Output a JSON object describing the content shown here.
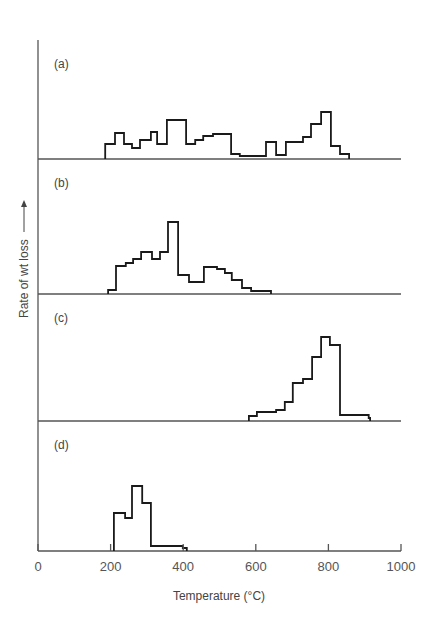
{
  "chart_data": {
    "type": "line",
    "subtype": "step-histogram",
    "title": "",
    "xlabel": "Temperature (°C)",
    "ylabel": "Rate of wt loss",
    "ylabel_arrow": "up",
    "xlim": [
      0,
      1000
    ],
    "x_ticks": [
      0,
      200,
      400,
      600,
      800,
      1000
    ],
    "x_tick_labels": [
      "0",
      "200",
      "400",
      "600",
      "800",
      "1000"
    ],
    "y_units": "relative (arbitrary)",
    "grid": false,
    "legend": null,
    "panels": [
      {
        "label": "(a)",
        "steps": [
          {
            "from": 185,
            "to": 212,
            "value": 15
          },
          {
            "from": 212,
            "to": 237,
            "value": 26
          },
          {
            "from": 237,
            "to": 259,
            "value": 15
          },
          {
            "from": 259,
            "to": 281,
            "value": 11
          },
          {
            "from": 281,
            "to": 311,
            "value": 19
          },
          {
            "from": 311,
            "to": 328,
            "value": 27
          },
          {
            "from": 328,
            "to": 355,
            "value": 15
          },
          {
            "from": 355,
            "to": 408,
            "value": 39
          },
          {
            "from": 408,
            "to": 433,
            "value": 15
          },
          {
            "from": 433,
            "to": 455,
            "value": 19
          },
          {
            "from": 455,
            "to": 482,
            "value": 23
          },
          {
            "from": 482,
            "to": 532,
            "value": 25
          },
          {
            "from": 532,
            "to": 556,
            "value": 5
          },
          {
            "from": 556,
            "to": 628,
            "value": 3
          },
          {
            "from": 628,
            "to": 656,
            "value": 17
          },
          {
            "from": 656,
            "to": 683,
            "value": 4
          },
          {
            "from": 683,
            "to": 730,
            "value": 17
          },
          {
            "from": 730,
            "to": 752,
            "value": 22
          },
          {
            "from": 752,
            "to": 780,
            "value": 35
          },
          {
            "from": 780,
            "to": 807,
            "value": 47
          },
          {
            "from": 807,
            "to": 832,
            "value": 13
          },
          {
            "from": 832,
            "to": 857,
            "value": 5
          }
        ]
      },
      {
        "label": "(b)",
        "steps": [
          {
            "from": 193,
            "to": 215,
            "value": 4
          },
          {
            "from": 215,
            "to": 242,
            "value": 28
          },
          {
            "from": 242,
            "to": 262,
            "value": 31
          },
          {
            "from": 262,
            "to": 284,
            "value": 35
          },
          {
            "from": 284,
            "to": 314,
            "value": 42
          },
          {
            "from": 314,
            "to": 336,
            "value": 35
          },
          {
            "from": 336,
            "to": 358,
            "value": 42
          },
          {
            "from": 358,
            "to": 386,
            "value": 72
          },
          {
            "from": 386,
            "to": 416,
            "value": 19
          },
          {
            "from": 416,
            "to": 457,
            "value": 12
          },
          {
            "from": 457,
            "to": 493,
            "value": 27
          },
          {
            "from": 493,
            "to": 515,
            "value": 25
          },
          {
            "from": 515,
            "to": 534,
            "value": 21
          },
          {
            "from": 534,
            "to": 562,
            "value": 14
          },
          {
            "from": 562,
            "to": 587,
            "value": 6
          },
          {
            "from": 587,
            "to": 642,
            "value": 3
          }
        ]
      },
      {
        "label": "(c)",
        "steps": [
          {
            "from": 581,
            "to": 603,
            "value": 5
          },
          {
            "from": 603,
            "to": 656,
            "value": 9
          },
          {
            "from": 656,
            "to": 680,
            "value": 11
          },
          {
            "from": 680,
            "to": 702,
            "value": 19
          },
          {
            "from": 702,
            "to": 730,
            "value": 38
          },
          {
            "from": 730,
            "to": 755,
            "value": 42
          },
          {
            "from": 755,
            "to": 780,
            "value": 64
          },
          {
            "from": 780,
            "to": 804,
            "value": 84
          },
          {
            "from": 804,
            "to": 832,
            "value": 76
          },
          {
            "from": 832,
            "to": 911,
            "value": 6
          },
          {
            "from": 911,
            "to": 915,
            "value": 3
          }
        ]
      },
      {
        "label": "(d)",
        "steps": [
          {
            "from": 209,
            "to": 240,
            "value": 38
          },
          {
            "from": 240,
            "to": 259,
            "value": 33
          },
          {
            "from": 259,
            "to": 287,
            "value": 65
          },
          {
            "from": 287,
            "to": 311,
            "value": 48
          },
          {
            "from": 311,
            "to": 399,
            "value": 5
          },
          {
            "from": 399,
            "to": 410,
            "value": 3
          }
        ]
      }
    ]
  },
  "layout_px": {
    "x0": 38,
    "px_per_degree": 0.363,
    "axis_top": 40,
    "baselines": [
      159,
      294,
      421,
      551
    ],
    "axis_end_x": 401
  }
}
